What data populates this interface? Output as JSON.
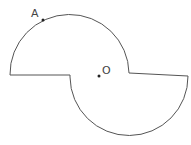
{
  "diagram": {
    "stroke_color": "#555555",
    "points": [
      {
        "label": "A",
        "x": 43,
        "y": 20
      },
      {
        "label": "O",
        "x": 99,
        "y": 76
      }
    ]
  }
}
